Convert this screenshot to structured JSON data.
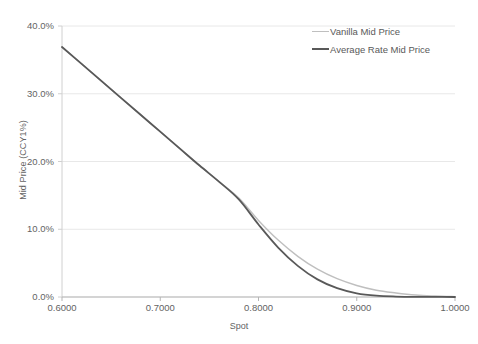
{
  "chart_data": {
    "type": "line",
    "title": "",
    "xlabel": "Spot",
    "ylabel": "Mid Price (CCY1%)",
    "xlim": [
      0.6,
      1.0
    ],
    "ylim": [
      0.0,
      40.0
    ],
    "grid": true,
    "legend_position": "top-right",
    "x_ticks": [
      "0.6000",
      "0.7000",
      "0.8000",
      "0.9000",
      "1.0000"
    ],
    "x_tick_values": [
      0.6,
      0.7,
      0.8,
      0.9,
      1.0
    ],
    "y_ticks": [
      "0.0%",
      "10.0%",
      "20.0%",
      "30.0%",
      "40.0%"
    ],
    "y_tick_values": [
      0.0,
      10.0,
      20.0,
      30.0,
      40.0
    ],
    "x": [
      0.6,
      0.62,
      0.64,
      0.66,
      0.68,
      0.7,
      0.72,
      0.74,
      0.76,
      0.78,
      0.8,
      0.82,
      0.84,
      0.86,
      0.88,
      0.9,
      0.92,
      0.94,
      0.96,
      0.98,
      1.0
    ],
    "series": [
      {
        "name": "Vanilla Mid Price",
        "color": "#BFBFBF",
        "width": 1.4,
        "values": [
          36.9,
          34.4,
          31.9,
          29.4,
          26.9,
          24.4,
          21.9,
          19.4,
          17.0,
          14.6,
          11.3,
          8.4,
          6.0,
          4.1,
          2.7,
          1.7,
          1.0,
          0.6,
          0.3,
          0.15,
          0.05
        ]
      },
      {
        "name": "Average Rate Mid Price",
        "color": "#595959",
        "width": 1.8,
        "values": [
          36.9,
          34.4,
          31.9,
          29.4,
          26.9,
          24.4,
          21.9,
          19.4,
          17.0,
          14.4,
          10.7,
          7.3,
          4.6,
          2.6,
          1.3,
          0.55,
          0.2,
          0.07,
          0.02,
          0.01,
          0.0
        ]
      }
    ]
  },
  "legend": {
    "entries": [
      {
        "label": "Vanilla Mid Price",
        "color": "#BFBFBF",
        "thickness": "1px"
      },
      {
        "label": "Average Rate Mid Price",
        "color": "#595959",
        "thickness": "2px"
      }
    ]
  },
  "colors": {
    "background": "#FFFFFF",
    "gridline": "#E8E8E8",
    "axis": "#D0D0D0",
    "text": "#636363"
  }
}
